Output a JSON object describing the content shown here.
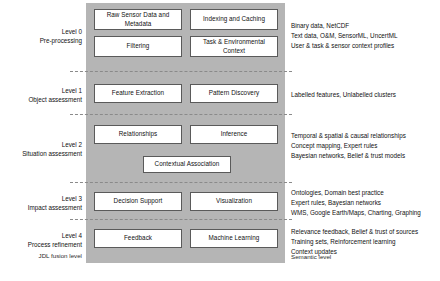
{
  "diagram": {
    "footer_left": "JDL fusion level",
    "footer_right": "Semantic level",
    "panel_color": "#b5b5b5",
    "box_border_color": "#5a5a5a"
  },
  "levels": [
    {
      "id": "level-0",
      "label_line1": "Level 0",
      "label_line2": "Pre-processing",
      "boxes": [
        {
          "name": "raw-sensor-data",
          "label": "Raw Sensor Data and Metadata"
        },
        {
          "name": "indexing-and-caching",
          "label": "Indexing and Caching"
        },
        {
          "name": "filtering",
          "label": "Filtering"
        },
        {
          "name": "task-environmental-context",
          "label": "Task & Environmental Context"
        }
      ],
      "annotations": [
        "Binary data, NetCDF",
        "Text data, O&M, SensorML, UncertML",
        "User & task & sensor context profiles"
      ]
    },
    {
      "id": "level-1",
      "label_line1": "Level 1",
      "label_line2": "Object assessment",
      "boxes": [
        {
          "name": "feature-extraction",
          "label": "Feature Extraction"
        },
        {
          "name": "pattern-discovery",
          "label": "Pattern Discovery"
        }
      ],
      "annotations": [
        "Labelled features, Unlabelled clusters"
      ]
    },
    {
      "id": "level-2",
      "label_line1": "Level 2",
      "label_line2": "Situation assessment",
      "boxes": [
        {
          "name": "relationships",
          "label": "Relationships"
        },
        {
          "name": "inference",
          "label": "Inference"
        },
        {
          "name": "contextual-association",
          "label": "Contextual Association"
        }
      ],
      "annotations": [
        "Temporal & spatial & causal relationships",
        "Concept mapping, Expert rules",
        "Bayesian networks, Belief & trust models"
      ]
    },
    {
      "id": "level-3",
      "label_line1": "Level 3",
      "label_line2": "Impact assessment",
      "boxes": [
        {
          "name": "decision-support",
          "label": "Decision Support"
        },
        {
          "name": "visualization",
          "label": "Visualization"
        }
      ],
      "annotations": [
        "Ontologies, Domain best practice",
        "Expert rules, Bayesian networks",
        "WMS, Google Earth/Maps, Charting, Graphing"
      ]
    },
    {
      "id": "level-4",
      "label_line1": "Level 4",
      "label_line2": "Process refinement",
      "boxes": [
        {
          "name": "feedback",
          "label": "Feedback"
        },
        {
          "name": "machine-learning",
          "label": "Machine Learning"
        }
      ],
      "annotations": [
        "Relevance feedback, Belief & trust of sources",
        "Training sets, Reinforcement learning",
        "Context updates"
      ]
    }
  ]
}
